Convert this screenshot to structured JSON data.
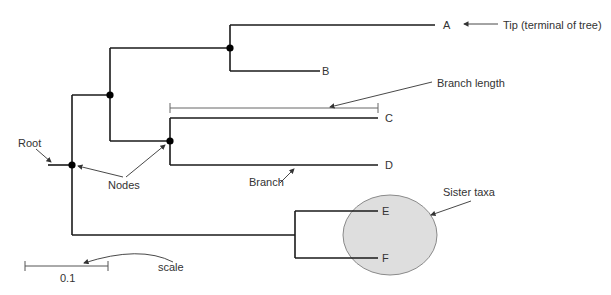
{
  "diagram": {
    "type": "phylogenetic-tree",
    "tips": [
      {
        "id": "A",
        "label": "A"
      },
      {
        "id": "B",
        "label": "B"
      },
      {
        "id": "C",
        "label": "C"
      },
      {
        "id": "D",
        "label": "D"
      },
      {
        "id": "E",
        "label": "E"
      },
      {
        "id": "F",
        "label": "F"
      }
    ],
    "annotations": {
      "tip": "Tip (terminal of tree)",
      "branch_length": "Branch length",
      "root": "Root",
      "nodes": "Nodes",
      "branch": "Branch",
      "sister_taxa": "Sister taxa",
      "scale": "scale"
    },
    "scale_bar": {
      "value": "0.1"
    },
    "colors": {
      "line": "#1a1a1a",
      "annotation_line": "#555555",
      "node": "#000000",
      "highlight_fill": "#dedede",
      "highlight_stroke": "#8a8a8a"
    }
  }
}
